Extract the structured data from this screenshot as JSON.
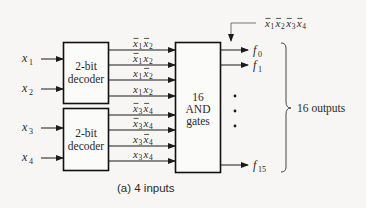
{
  "diagram": {
    "caption": "(a) 4 inputs",
    "inputs": [
      {
        "var": "x",
        "sub": "1"
      },
      {
        "var": "x",
        "sub": "2"
      },
      {
        "var": "x",
        "sub": "3"
      },
      {
        "var": "x",
        "sub": "4"
      }
    ],
    "decoders": [
      {
        "line1": "2-bit",
        "line2": "decoder"
      },
      {
        "line1": "2-bit",
        "line2": "decoder"
      }
    ],
    "decoder_outputs": [
      [
        {
          "terms": [
            {
              "v": "x",
              "s": "1",
              "bar": true
            },
            {
              "v": "x",
              "s": "2",
              "bar": true
            }
          ]
        },
        {
          "terms": [
            {
              "v": "x",
              "s": "1",
              "bar": true
            },
            {
              "v": "x",
              "s": "2",
              "bar": false
            }
          ]
        },
        {
          "terms": [
            {
              "v": "x",
              "s": "1",
              "bar": false
            },
            {
              "v": "x",
              "s": "2",
              "bar": true
            }
          ]
        },
        {
          "terms": [
            {
              "v": "x",
              "s": "1",
              "bar": false
            },
            {
              "v": "x",
              "s": "2",
              "bar": false
            }
          ]
        }
      ],
      [
        {
          "terms": [
            {
              "v": "x",
              "s": "3",
              "bar": true
            },
            {
              "v": "x",
              "s": "4",
              "bar": true
            }
          ]
        },
        {
          "terms": [
            {
              "v": "x",
              "s": "3",
              "bar": true
            },
            {
              "v": "x",
              "s": "4",
              "bar": false
            }
          ]
        },
        {
          "terms": [
            {
              "v": "x",
              "s": "3",
              "bar": false
            },
            {
              "v": "x",
              "s": "4",
              "bar": true
            }
          ]
        },
        {
          "terms": [
            {
              "v": "x",
              "s": "3",
              "bar": false
            },
            {
              "v": "x",
              "s": "4",
              "bar": false
            }
          ]
        }
      ]
    ],
    "and_block": {
      "line1": "16",
      "line2": "AND",
      "line3": "gates"
    },
    "outputs": [
      {
        "var": "f",
        "sub": "0"
      },
      {
        "var": "f",
        "sub": "1"
      },
      {
        "var": "f",
        "sub": "15"
      }
    ],
    "f0_annotation": [
      {
        "v": "x",
        "s": "1",
        "bar": true
      },
      {
        "v": "x",
        "s": "2",
        "bar": true
      },
      {
        "v": "x",
        "s": "3",
        "bar": true
      },
      {
        "v": "x",
        "s": "4",
        "bar": true
      }
    ],
    "brace_label": "16 outputs",
    "ellipsis": "•"
  }
}
